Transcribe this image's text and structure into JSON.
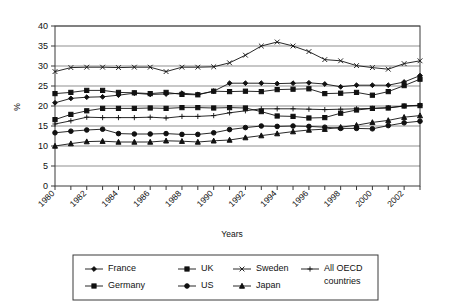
{
  "chart_data": {
    "type": "line",
    "title": "",
    "xlabel": "Years",
    "ylabel": "%",
    "xlim": [
      1980,
      2003
    ],
    "ylim": [
      0,
      40
    ],
    "ytick_step": 5,
    "yticks": [
      0,
      5,
      10,
      15,
      20,
      25,
      30,
      35,
      40
    ],
    "grid": "horizontal",
    "legend_position": "bottom",
    "x": [
      1980,
      1981,
      1982,
      1983,
      1984,
      1985,
      1986,
      1987,
      1988,
      1989,
      1990,
      1991,
      1992,
      1993,
      1994,
      1995,
      1996,
      1997,
      1998,
      1999,
      2000,
      2001,
      2002,
      2003
    ],
    "xtick_labels": [
      "1980",
      "1982",
      "1984",
      "1986",
      "1988",
      "1990",
      "1992",
      "1994",
      "1996",
      "1998",
      "2000",
      "2002"
    ],
    "series": [
      {
        "name": "France",
        "marker": "diamond",
        "values": [
          20.8,
          21.9,
          22.2,
          22.3,
          22.7,
          23.2,
          22.9,
          23.0,
          23.2,
          22.9,
          23.7,
          25.7,
          25.7,
          25.7,
          25.6,
          25.7,
          25.8,
          25.5,
          24.8,
          25.2,
          25.2,
          25.2,
          26.0,
          27.6
        ]
      },
      {
        "name": "Germany",
        "marker": "square",
        "values": [
          23.1,
          23.4,
          23.9,
          23.9,
          23.4,
          23.3,
          23.1,
          23.4,
          22.9,
          22.8,
          23.7,
          23.6,
          23.7,
          23.6,
          24.1,
          24.2,
          24.3,
          23.1,
          23.2,
          23.4,
          22.7,
          23.6,
          25.1,
          26.7
        ]
      },
      {
        "name": "UK",
        "marker": "square",
        "values": [
          16.6,
          17.9,
          18.8,
          19.4,
          19.4,
          19.4,
          19.5,
          19.4,
          19.6,
          19.6,
          19.5,
          19.6,
          19.5,
          18.6,
          17.5,
          17.4,
          17.0,
          17.1,
          18.2,
          19.0,
          19.4,
          19.5,
          20.0,
          20.1
        ]
      },
      {
        "name": "US",
        "marker": "circle",
        "values": [
          13.3,
          13.7,
          14.0,
          14.2,
          13.1,
          13.0,
          13.0,
          13.1,
          12.9,
          12.9,
          13.3,
          14.1,
          14.6,
          15.0,
          14.9,
          15.0,
          14.9,
          14.7,
          14.4,
          14.4,
          14.3,
          15.1,
          15.8,
          16.2
        ]
      },
      {
        "name": "Japan",
        "marker": "triangle",
        "values": [
          10.0,
          10.6,
          11.1,
          11.2,
          11.0,
          11.0,
          11.0,
          11.3,
          11.2,
          11.0,
          11.3,
          11.5,
          12.1,
          12.6,
          13.1,
          13.6,
          14.0,
          14.2,
          14.7,
          15.2,
          15.9,
          16.4,
          17.2,
          17.6
        ]
      },
      {
        "name": "Sweden",
        "marker": "x",
        "values": [
          28.6,
          29.6,
          29.7,
          29.7,
          29.6,
          29.7,
          29.7,
          28.6,
          29.7,
          29.7,
          29.8,
          30.8,
          32.7,
          35.0,
          36.0,
          35.0,
          33.6,
          31.6,
          31.3,
          30.1,
          29.6,
          29.2,
          30.6,
          31.3
        ]
      },
      {
        "name": "All OECD countries",
        "marker": "plus",
        "values": [
          15.5,
          16.3,
          17.2,
          17.1,
          17.1,
          17.1,
          17.2,
          17.0,
          17.4,
          17.4,
          17.6,
          18.3,
          18.8,
          19.3,
          19.3,
          19.3,
          19.2,
          19.1,
          19.2,
          19.3,
          19.4,
          19.6,
          20.0,
          20.2
        ]
      }
    ],
    "legend_rows": [
      [
        "France",
        "UK",
        "Sweden",
        "All OECD countries"
      ],
      [
        "Germany",
        "US",
        "Japan"
      ]
    ]
  }
}
